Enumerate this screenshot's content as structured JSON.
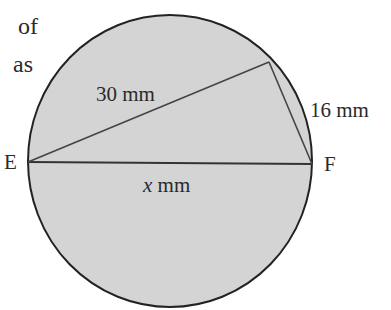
{
  "question_fragment": {
    "line1": "of",
    "line2": "as"
  },
  "diagram": {
    "circle": {
      "cx": 170,
      "cy": 161,
      "rx": 142,
      "ry": 146,
      "fill": "#d4d4d4",
      "stroke": "#222222"
    },
    "points": {
      "E": {
        "label": "E",
        "x": 28,
        "y": 162
      },
      "F": {
        "label": "F",
        "x": 312,
        "y": 164
      },
      "G": {
        "x": 269,
        "y": 62
      }
    },
    "labels": {
      "side_EG": "30 mm",
      "side_GF": "16 mm",
      "side_EF_var": "x",
      "side_EF_unit": " mm"
    }
  }
}
